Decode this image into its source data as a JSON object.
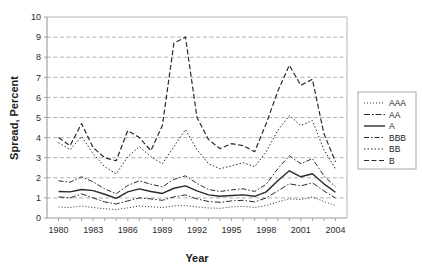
{
  "chart_data": {
    "type": "line",
    "title": "",
    "xlabel": "Year",
    "ylabel": "Spread, Percent",
    "xlim": [
      1979,
      2005
    ],
    "ylim": [
      0,
      10
    ],
    "ytick_labels": [
      "0",
      "1",
      "2",
      "3",
      "4",
      "5",
      "6",
      "7",
      "8",
      "9",
      "10"
    ],
    "yticks": [
      0,
      1,
      2,
      3,
      4,
      5,
      6,
      7,
      8,
      9,
      10
    ],
    "xtick_labels": [
      "1980",
      "1983",
      "1986",
      "1989",
      "1992",
      "1995",
      "1998",
      "2001",
      "2004"
    ],
    "xticks": [
      1980,
      1983,
      1986,
      1989,
      1992,
      1995,
      1998,
      2001,
      2004
    ],
    "x": [
      1980,
      1981,
      1982,
      1983,
      1984,
      1985,
      1986,
      1987,
      1988,
      1989,
      1990,
      1991,
      1992,
      1993,
      1994,
      1995,
      1996,
      1997,
      1998,
      1999,
      2000,
      2001,
      2002,
      2003,
      2004
    ],
    "grid": true,
    "grid_axis": "y",
    "legend_position": "right",
    "series": [
      {
        "name": "AAA",
        "dash": "1,2",
        "width": 1.0,
        "values": [
          0.55,
          0.52,
          0.6,
          0.52,
          0.46,
          0.42,
          0.5,
          0.6,
          0.56,
          0.52,
          0.6,
          0.62,
          0.55,
          0.5,
          0.48,
          0.55,
          0.58,
          0.52,
          0.62,
          0.8,
          0.95,
          0.92,
          1.05,
          0.82,
          0.62
        ]
      },
      {
        "name": "AA",
        "dash": "6,2,1.5,2",
        "width": 1.0,
        "values": [
          1.05,
          1.0,
          1.2,
          1.0,
          0.8,
          0.7,
          0.85,
          1.0,
          0.95,
          0.88,
          1.05,
          1.15,
          0.95,
          0.82,
          0.78,
          0.85,
          0.88,
          0.8,
          1.0,
          1.35,
          1.7,
          1.6,
          1.75,
          1.35,
          1.0
        ]
      },
      {
        "name": "A",
        "dash": "none",
        "width": 1.4,
        "values": [
          1.32,
          1.3,
          1.42,
          1.36,
          1.18,
          0.98,
          1.3,
          1.45,
          1.32,
          1.22,
          1.48,
          1.6,
          1.35,
          1.15,
          1.08,
          1.12,
          1.15,
          1.08,
          1.3,
          1.85,
          2.35,
          2.05,
          2.2,
          1.7,
          1.28
        ]
      },
      {
        "name": "BBB",
        "dash": "5,2,1.5,2",
        "width": 1.0,
        "values": [
          1.85,
          1.78,
          2.05,
          1.8,
          1.45,
          1.2,
          1.62,
          1.85,
          1.68,
          1.55,
          1.92,
          2.1,
          1.72,
          1.42,
          1.32,
          1.4,
          1.45,
          1.32,
          1.68,
          2.45,
          3.1,
          2.7,
          2.95,
          2.1,
          1.55
        ]
      },
      {
        "name": "BB",
        "dash": "1.5,2",
        "width": 1.0,
        "values": [
          3.75,
          3.4,
          4.05,
          3.2,
          2.55,
          2.2,
          3.05,
          3.55,
          3.05,
          2.7,
          3.55,
          4.4,
          3.4,
          2.7,
          2.45,
          2.6,
          2.75,
          2.55,
          3.3,
          4.35,
          5.1,
          4.6,
          4.85,
          3.4,
          2.45
        ]
      },
      {
        "name": "B",
        "dash": "5,2.5",
        "width": 1.2,
        "values": [
          4.0,
          3.6,
          4.7,
          3.5,
          3.0,
          2.85,
          4.35,
          4.0,
          3.35,
          4.6,
          8.7,
          9.0,
          5.0,
          3.9,
          3.45,
          3.7,
          3.6,
          3.3,
          4.7,
          6.3,
          7.6,
          6.6,
          6.9,
          4.2,
          2.8
        ]
      }
    ]
  },
  "legend": {
    "items": [
      {
        "label": "AAA"
      },
      {
        "label": "AA"
      },
      {
        "label": "A"
      },
      {
        "label": "BBB"
      },
      {
        "label": "BB"
      },
      {
        "label": "B"
      }
    ]
  },
  "colors": {
    "line": "#2a2a2a",
    "grid": "#8f8f8f",
    "axis": "#9a9a9a",
    "text": "#1a1a1a",
    "background": "#ffffff"
  }
}
